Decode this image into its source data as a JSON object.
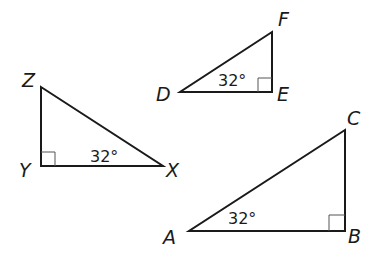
{
  "figure": {
    "triangles": [
      {
        "name": "triangle-XYZ",
        "vertices": {
          "Z": {
            "label": "Z",
            "x": 41,
            "y": 87
          },
          "Y": {
            "label": "Y",
            "x": 41,
            "y": 166
          },
          "X": {
            "label": "X",
            "x": 163,
            "y": 166
          }
        },
        "right_angle_at": "Y",
        "angle_label": "32°",
        "angle_at": "X"
      },
      {
        "name": "triangle-DEF",
        "vertices": {
          "D": {
            "label": "D",
            "x": 180,
            "y": 92
          },
          "E": {
            "label": "E",
            "x": 272,
            "y": 92
          },
          "F": {
            "label": "F",
            "x": 272,
            "y": 32
          }
        },
        "right_angle_at": "E",
        "angle_label": "32°",
        "angle_at": "D"
      },
      {
        "name": "triangle-ABC",
        "vertices": {
          "A": {
            "label": "A",
            "x": 189,
            "y": 231
          },
          "B": {
            "label": "B",
            "x": 345,
            "y": 231
          },
          "C": {
            "label": "C",
            "x": 345,
            "y": 130
          }
        },
        "right_angle_at": "B",
        "angle_label": "32°",
        "angle_at": "A"
      }
    ]
  },
  "labels": {
    "Z": "Z",
    "Y": "Y",
    "X": "X",
    "D": "D",
    "E": "E",
    "F": "F",
    "A": "A",
    "B": "B",
    "C": "C",
    "angle_xyz": "32°",
    "angle_def": "32°",
    "angle_abc": "32°"
  },
  "colors": {
    "stroke": "#1a1a1a",
    "right_angle_mark": "#555555",
    "background": "#ffffff"
  }
}
